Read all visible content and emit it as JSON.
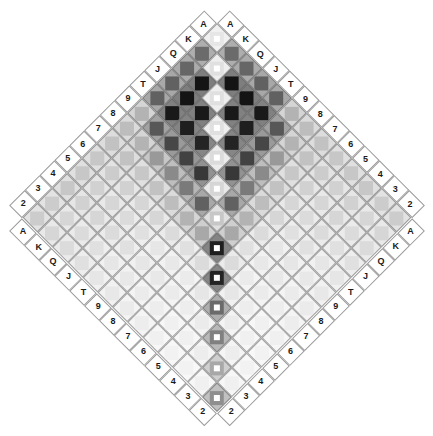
{
  "figure": {
    "title": "",
    "type": "rotated-matrix-heatmap",
    "rotation_degrees": 45,
    "background_color": "#ffffff",
    "grid_line_color": "#5a5a5a",
    "label_box_border_color": "#9a9a9a",
    "label_text_color": "#1a1a1a"
  },
  "axes": {
    "top_left_edge": {
      "name": "top-left-axis",
      "direction": "up-right",
      "labels": [
        "A",
        "K",
        "Q",
        "J",
        "T",
        "9",
        "8",
        "7",
        "6",
        "5",
        "4",
        "3",
        "2"
      ]
    },
    "top_right_edge": {
      "name": "top-right-axis",
      "direction": "down-right",
      "labels": [
        "A",
        "K",
        "Q",
        "J",
        "T",
        "9",
        "8",
        "7",
        "6",
        "5",
        "4",
        "3",
        "2"
      ]
    },
    "bottom_left_edge": {
      "name": "bottom-left-axis",
      "direction": "down-right",
      "labels": [
        "A",
        "K",
        "Q",
        "J",
        "T",
        "9",
        "8",
        "7",
        "6",
        "5",
        "4",
        "3",
        "2"
      ]
    },
    "bottom_right_edge": {
      "name": "bottom-right-axis",
      "direction": "up-right",
      "labels": [
        "A",
        "K",
        "Q",
        "J",
        "T",
        "9",
        "8",
        "7",
        "6",
        "5",
        "4",
        "3",
        "2"
      ]
    }
  },
  "chart_data": {
    "type": "heatmap",
    "title": "",
    "xlabel": "",
    "ylabel": "",
    "grid": true,
    "legend": "none",
    "orientation": "diamond (matrix rotated 45 degrees)",
    "rows": [
      "A",
      "K",
      "Q",
      "J",
      "T",
      "9",
      "8",
      "7",
      "6",
      "5",
      "4",
      "3",
      "2"
    ],
    "columns": [
      "A",
      "K",
      "Q",
      "J",
      "T",
      "9",
      "8",
      "7",
      "6",
      "5",
      "4",
      "3",
      "2"
    ],
    "value_range": [
      0,
      1
    ],
    "colormap": "grayscale (0 = white, 1 = black)",
    "values": [
      [
        0.1,
        0.58,
        0.6,
        0.62,
        0.62,
        0.3,
        0.26,
        0.24,
        0.22,
        0.22,
        0.22,
        0.2,
        0.2
      ],
      [
        0.58,
        0.12,
        0.92,
        0.92,
        0.9,
        0.66,
        0.3,
        0.24,
        0.2,
        0.18,
        0.18,
        0.16,
        0.16
      ],
      [
        0.6,
        0.92,
        0.12,
        0.9,
        0.88,
        0.72,
        0.4,
        0.22,
        0.18,
        0.16,
        0.16,
        0.14,
        0.14
      ],
      [
        0.62,
        0.92,
        0.9,
        0.12,
        0.86,
        0.74,
        0.46,
        0.24,
        0.16,
        0.14,
        0.14,
        0.12,
        0.12
      ],
      [
        0.62,
        0.9,
        0.88,
        0.86,
        0.14,
        0.78,
        0.52,
        0.26,
        0.16,
        0.12,
        0.12,
        0.1,
        0.1
      ],
      [
        0.3,
        0.66,
        0.72,
        0.74,
        0.78,
        0.16,
        0.62,
        0.3,
        0.14,
        0.1,
        0.1,
        0.09,
        0.09
      ],
      [
        0.26,
        0.3,
        0.4,
        0.46,
        0.52,
        0.62,
        0.22,
        0.34,
        0.12,
        0.09,
        0.09,
        0.08,
        0.08
      ],
      [
        0.24,
        0.24,
        0.22,
        0.24,
        0.26,
        0.3,
        0.34,
        0.88,
        0.14,
        0.08,
        0.08,
        0.07,
        0.07
      ],
      [
        0.22,
        0.2,
        0.18,
        0.16,
        0.16,
        0.14,
        0.12,
        0.14,
        0.86,
        0.1,
        0.07,
        0.06,
        0.06
      ],
      [
        0.22,
        0.18,
        0.16,
        0.14,
        0.12,
        0.1,
        0.09,
        0.08,
        0.1,
        0.58,
        0.08,
        0.06,
        0.05
      ],
      [
        0.22,
        0.18,
        0.16,
        0.14,
        0.12,
        0.1,
        0.09,
        0.08,
        0.07,
        0.08,
        0.5,
        0.07,
        0.05
      ],
      [
        0.2,
        0.16,
        0.14,
        0.12,
        0.1,
        0.09,
        0.08,
        0.07,
        0.06,
        0.06,
        0.07,
        0.34,
        0.06
      ],
      [
        0.2,
        0.16,
        0.14,
        0.12,
        0.1,
        0.09,
        0.08,
        0.07,
        0.06,
        0.05,
        0.05,
        0.06,
        0.44
      ]
    ],
    "diagonal_marker_values": [
      1.0,
      1.0,
      1.0,
      1.0,
      1.0,
      1.0,
      1.0,
      1.0,
      1.0,
      1.0,
      1.0,
      1.0,
      1.0
    ]
  }
}
